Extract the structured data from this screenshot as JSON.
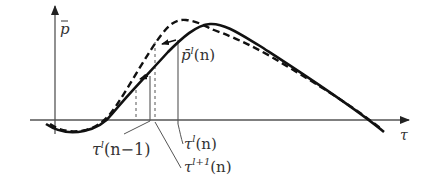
{
  "diagram": {
    "type": "function-plot",
    "colors": {
      "curve": "#111111",
      "axis": "#555555",
      "guide": "#666666",
      "text": "#333333"
    },
    "axes": {
      "y_label": {
        "base": "p",
        "accent": "¯"
      },
      "x_label": "τ"
    },
    "curves": [
      {
        "name": "p-bar-l",
        "style": "solid"
      },
      {
        "name": "p-bar-l+1",
        "style": "dashed"
      }
    ],
    "labels": {
      "p_bar_l_n": {
        "base": "p̄",
        "sup": "l",
        "arg": "(n)"
      },
      "tau_l_n_minus_1": {
        "base": "τ",
        "sup": "l",
        "arg": "(n−1)"
      },
      "tau_l_n": {
        "base": "τ",
        "sup": "l",
        "arg": "(n)"
      },
      "tau_l_plus_1_n": {
        "base": "τ",
        "sup": "l+1",
        "arg": "(n)"
      }
    }
  }
}
